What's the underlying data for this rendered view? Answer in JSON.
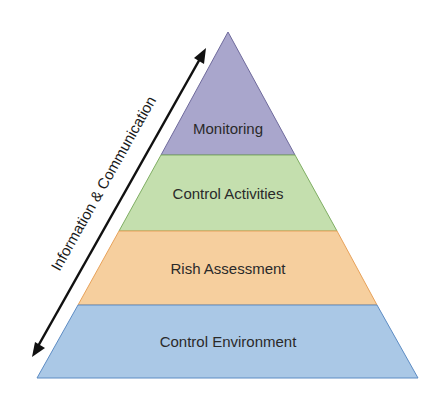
{
  "diagram": {
    "type": "pyramid",
    "side_label": "Information & Communication",
    "layers": [
      {
        "label": "Monitoring",
        "color": "#a9a6cc",
        "stroke": "#6f6a9c"
      },
      {
        "label": "Control Activities",
        "color": "#c4dfae",
        "stroke": "#7fae63"
      },
      {
        "label": "Rish Assessment",
        "color": "#f6cf9e",
        "stroke": "#e8a25a"
      },
      {
        "label": "Control Environment",
        "color": "#aac8e6",
        "stroke": "#5d8cc4"
      }
    ]
  }
}
